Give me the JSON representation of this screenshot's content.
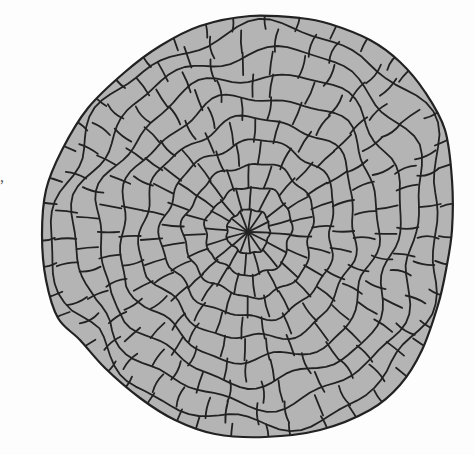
{
  "figure": {
    "type": "cellular-tissue-cross-section",
    "colors": {
      "background": "#fdfdfd",
      "cell_fill": "#b4b4b4",
      "cell_wall": "#222222",
      "bleed_through_text": "#e9e9e9"
    },
    "outline_points": [
      [
        250,
        16
      ],
      [
        300,
        18
      ],
      [
        330,
        24
      ],
      [
        370,
        40
      ],
      [
        400,
        62
      ],
      [
        425,
        92
      ],
      [
        445,
        130
      ],
      [
        452,
        180
      ],
      [
        452,
        230
      ],
      [
        446,
        270
      ],
      [
        438,
        305
      ],
      [
        422,
        350
      ],
      [
        400,
        385
      ],
      [
        370,
        410
      ],
      [
        320,
        430
      ],
      [
        265,
        437
      ],
      [
        215,
        434
      ],
      [
        175,
        420
      ],
      [
        140,
        398
      ],
      [
        105,
        368
      ],
      [
        80,
        340
      ],
      [
        58,
        318
      ],
      [
        46,
        280
      ],
      [
        42,
        235
      ],
      [
        46,
        190
      ],
      [
        62,
        150
      ],
      [
        88,
        108
      ],
      [
        125,
        72
      ],
      [
        160,
        46
      ],
      [
        200,
        26
      ]
    ],
    "center": [
      248,
      232
    ],
    "rings": 9,
    "radial_files": 44
  },
  "page_marks": {
    "stray_punctuation": ","
  }
}
